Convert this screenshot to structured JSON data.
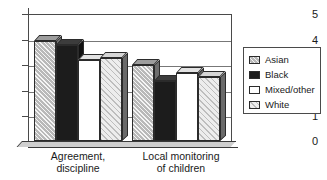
{
  "chart_data": {
    "type": "bar",
    "title": "",
    "subtitle": "",
    "xlabel": "",
    "ylabel": "",
    "ylim": [
      0,
      5
    ],
    "yticks": [
      0,
      1,
      2,
      3,
      4,
      5
    ],
    "ytick_labels": [
      "0",
      "1",
      "2",
      "3",
      "4",
      "5"
    ],
    "grid": true,
    "grid_axis": "y",
    "legend_position": "right",
    "style": "3d-clustered-column",
    "categories": [
      "Agreement,\ndiscipline",
      "Local monitoring\nof children"
    ],
    "category_labels_flat": [
      "Agreement, discipline",
      "Local monitoring of children"
    ],
    "series": [
      {
        "name": "Asian",
        "swatch": "hatched-gray",
        "color": "#b9b9b9",
        "values": [
          3.95,
          3.0
        ]
      },
      {
        "name": "Black",
        "swatch": "solid-black",
        "color": "#1c1c1c",
        "values": [
          3.8,
          2.4
        ]
      },
      {
        "name": "Mixed/other",
        "swatch": "white",
        "color": "#ffffff",
        "values": [
          3.2,
          2.7
        ]
      },
      {
        "name": "White",
        "swatch": "light-hatched",
        "color": "#ededed",
        "values": [
          3.3,
          2.55
        ]
      }
    ]
  },
  "legend": {
    "items": [
      {
        "label": "Asian"
      },
      {
        "label": "Black"
      },
      {
        "label": "Mixed/other"
      },
      {
        "label": "White"
      }
    ]
  },
  "axis": {
    "y_labels": [
      "5",
      "4",
      "3",
      "2",
      "1",
      "0"
    ]
  }
}
